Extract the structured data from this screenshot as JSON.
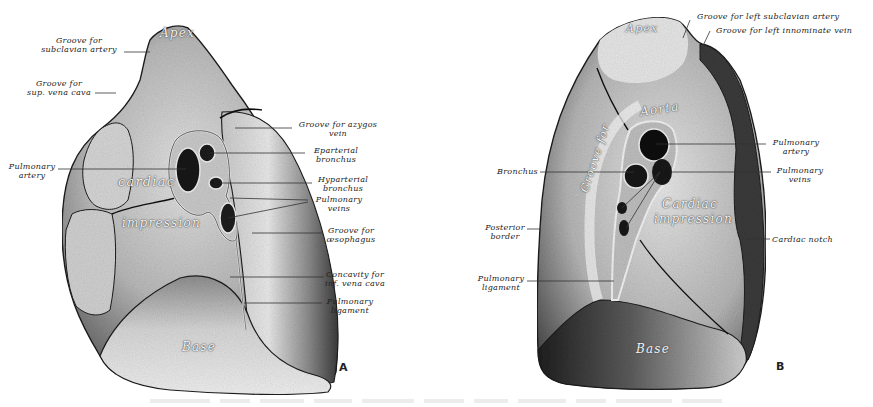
{
  "figure": {
    "type": "anatomical-illustration",
    "caption_visible": "illegible (very faint)",
    "colors": {
      "background": "#ffffff",
      "ink": "#222222",
      "lung_light": "#d8d8d8",
      "lung_mid": "#9a9a9a",
      "lung_dark": "#3a3a3a",
      "vessel": "#111111"
    }
  },
  "panels": [
    {
      "letter": "A",
      "side": "right lung",
      "regions": {
        "apex": "Apex",
        "cardiac": "cardiac",
        "impression": "impression",
        "base": "Base"
      },
      "labels_left": [
        {
          "line1": "Groove for",
          "line2": "subclavian artery"
        },
        {
          "line1": "Groove for",
          "line2": "sup. vena cava"
        },
        {
          "line1": "Pulmonary",
          "line2": "artery"
        }
      ],
      "labels_right": [
        {
          "line1": "Groove for azygos",
          "line2": "vein"
        },
        {
          "line1": "Eparterial",
          "line2": "bronchus"
        },
        {
          "line1": "Hyparterial",
          "line2": "bronchus"
        },
        {
          "line1": "Pulmonary",
          "line2": "veins"
        },
        {
          "line1": "Groove for",
          "line2": "œsophagus"
        },
        {
          "line1": "Concavity for",
          "line2": "inf. vena cava"
        },
        {
          "line1": "Pulmonary",
          "line2": "ligament"
        }
      ]
    },
    {
      "letter": "B",
      "side": "left lung",
      "regions": {
        "apex": "Apex",
        "aorta": "Aorta",
        "groove_for": "Groove for",
        "cardiac": "Cardiac",
        "impression": "impression",
        "base": "Base"
      },
      "labels_top": [
        {
          "line1": "Groove for left subclavian artery"
        },
        {
          "line1": "Groove for left innominate vein"
        }
      ],
      "labels_left": [
        {
          "line1": "Bronchus"
        },
        {
          "line1": "Posterior",
          "line2": "border"
        },
        {
          "line1": "Pulmonary",
          "line2": "ligament"
        }
      ],
      "labels_right": [
        {
          "line1": "Pulmonary",
          "line2": "artery"
        },
        {
          "line1": "Pulmonary",
          "line2": "veins"
        },
        {
          "line1": "Cardiac notch"
        }
      ]
    }
  ]
}
